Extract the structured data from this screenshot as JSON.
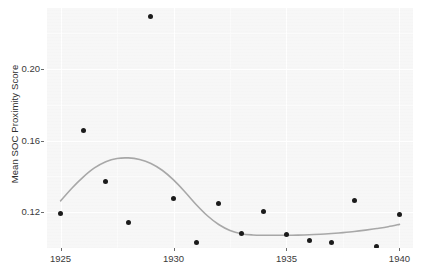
{
  "chart_data": {
    "type": "scatter",
    "title": "",
    "subtitle": "",
    "xlabel": "",
    "ylabel": "Mean SOC Proximity Score",
    "xlim": [
      1924.4,
      1940.6
    ],
    "ylim": [
      0.1,
      0.234
    ],
    "grid": true,
    "legend": null,
    "x_ticks": [
      1925,
      1930,
      1935,
      1940
    ],
    "x_tick_labels": [
      "1925",
      "1930",
      "1935",
      "1940"
    ],
    "y_ticks": [
      0.12,
      0.16,
      0.2
    ],
    "y_tick_labels": [
      "0.12",
      "0.16",
      "0.20"
    ],
    "x": [
      1925,
      1926,
      1927,
      1928,
      1929,
      1930,
      1931,
      1932,
      1933,
      1934,
      1935,
      1936,
      1937,
      1938,
      1939,
      1940
    ],
    "values": [
      0.119,
      0.1658,
      0.1372,
      0.1145,
      0.229,
      0.1275,
      0.1033,
      0.1248,
      0.1079,
      0.1204,
      0.1074,
      0.1044,
      0.103,
      0.1268,
      0.1008,
      0.1187
    ],
    "series": [
      {
        "name": "Mean SOC Proximity Score",
        "type": "scatter",
        "marker": "filled-circle",
        "color": "#1b1b1b",
        "values": [
          0.119,
          0.1658,
          0.1372,
          0.1145,
          0.229,
          0.1275,
          0.1033,
          0.1248,
          0.1079,
          0.1204,
          0.1074,
          0.1044,
          0.103,
          0.1268,
          0.1008,
          0.1187
        ]
      },
      {
        "name": "LOESS smooth trend",
        "type": "line",
        "color": "#a8a8a8",
        "x": [
          1925,
          1925.5,
          1926,
          1926.5,
          1927,
          1927.5,
          1928,
          1928.5,
          1929,
          1929.5,
          1930,
          1930.5,
          1931,
          1931.5,
          1932,
          1932.5,
          1933,
          1933.5,
          1934,
          1934.5,
          1935,
          1935.5,
          1936,
          1936.5,
          1937,
          1937.5,
          1938,
          1938.5,
          1939,
          1939.5,
          1940
        ],
        "values": [
          0.1263,
          0.1334,
          0.1396,
          0.1447,
          0.1482,
          0.15,
          0.1503,
          0.1494,
          0.1472,
          0.1434,
          0.138,
          0.1314,
          0.1243,
          0.118,
          0.1131,
          0.1098,
          0.108,
          0.1073,
          0.1071,
          0.1071,
          0.1071,
          0.1072,
          0.1074,
          0.1077,
          0.1081,
          0.1086,
          0.1092,
          0.11,
          0.1109,
          0.1119,
          0.1132
        ]
      }
    ],
    "panel_background": "#f7f7f7",
    "gridline_color": "#ffffff",
    "point_color": "#1b1b1b",
    "smooth_color": "#a8a8a8",
    "axis_text_color": "#3a3a3a"
  }
}
